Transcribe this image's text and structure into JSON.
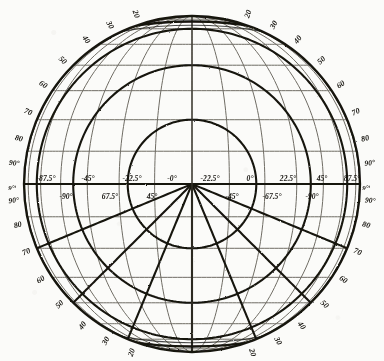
{
  "figure": {
    "background_color": "#fbfbf9",
    "ink_color": "#16140f",
    "faint_ink_color": "#6d6a63"
  },
  "chart_data": {
    "type": "scatter",
    "xlabel": "",
    "ylabel": "",
    "grid": true,
    "legend": "none",
    "projection": {
      "outline": "circle",
      "center_x": 192,
      "center_y": 184,
      "radius": 168,
      "center_meridian_longitude": "0",
      "cap_arc_top": true,
      "cap_arc_bottom": true
    },
    "latitude_ticks": [
      20,
      30,
      40,
      50,
      60,
      70,
      80,
      90
    ],
    "rim_label_quadrants": [
      "top-left",
      "top-right",
      "bottom-left",
      "bottom-right"
    ],
    "equator_labels_upper": [
      "-87.5°",
      "-45°",
      "-22.5°",
      "-0°",
      "-22.5°",
      "0°",
      "22.5°",
      "45°",
      "87.5°"
    ],
    "equator_labels_lower": [
      "-90°",
      "67.5°",
      "45°",
      "-45°",
      "-67.5°",
      "-90°"
    ],
    "edge_markers": [
      "9°ᵗ",
      "9°ᵗ"
    ],
    "graticule_fine": {
      "style": "thin grey",
      "parallel_count": 16,
      "meridian_count": 14
    },
    "graticule_bold": {
      "style": "thick black oblique",
      "parallel_count": 7,
      "meridian_count": 9
    }
  },
  "rim_labels": {
    "top_left": [
      {
        "t": "90°",
        "a": -96
      },
      {
        "t": "80",
        "a": -104
      },
      {
        "t": "70",
        "a": -113
      },
      {
        "t": "60",
        "a": -123
      },
      {
        "t": "50",
        "a": -133
      },
      {
        "t": "40",
        "a": -143
      },
      {
        "t": "30",
        "a": -152
      },
      {
        "t": "20",
        "a": -161
      }
    ],
    "top_right": [
      {
        "t": "90°",
        "a": -84
      },
      {
        "t": "80",
        "a": -76
      },
      {
        "t": "70",
        "a": -67
      },
      {
        "t": "60",
        "a": -57
      },
      {
        "t": "50",
        "a": -47
      },
      {
        "t": "40",
        "a": -37
      },
      {
        "t": "30",
        "a": -28
      },
      {
        "t": "20",
        "a": -19
      }
    ],
    "bottom_left": [
      {
        "t": "90°",
        "a": 96
      },
      {
        "t": "80",
        "a": 104
      },
      {
        "t": "70",
        "a": 113
      },
      {
        "t": "60",
        "a": 123
      },
      {
        "t": "50",
        "a": 133
      },
      {
        "t": "40",
        "a": 143
      },
      {
        "t": "30",
        "a": 152
      },
      {
        "t": "20",
        "a": 161
      }
    ],
    "bottom_right": [
      {
        "t": "90°",
        "a": 84
      },
      {
        "t": "80",
        "a": 76
      },
      {
        "t": "70",
        "a": 67
      },
      {
        "t": "60",
        "a": 57
      },
      {
        "t": "50",
        "a": 47
      },
      {
        "t": "40",
        "a": 37
      },
      {
        "t": "30",
        "a": 28
      },
      {
        "t": "20",
        "a": 19
      }
    ]
  },
  "equator_row_upper": [
    {
      "t": "-87.5°",
      "x": 46
    },
    {
      "t": "-45°",
      "x": 88
    },
    {
      "t": "-22.5°",
      "x": 132
    },
    {
      "t": "-0°",
      "x": 172
    },
    {
      "t": "-22.5°",
      "x": 210
    },
    {
      "t": "0°",
      "x": 250
    },
    {
      "t": "22.5°",
      "x": 288
    },
    {
      "t": "45°",
      "x": 322
    },
    {
      "t": "87.5°",
      "x": 352
    }
  ],
  "equator_row_lower": [
    {
      "t": "-90°",
      "x": 66
    },
    {
      "t": "67.5°",
      "x": 110
    },
    {
      "t": "45°",
      "x": 152
    },
    {
      "t": "-45°",
      "x": 232
    },
    {
      "t": "-67.5°",
      "x": 272
    },
    {
      "t": "-90°",
      "x": 312
    }
  ],
  "side_markers": [
    {
      "t": "9°ᵗ",
      "x": 12,
      "y": 190
    },
    {
      "t": "9°ᵗ",
      "x": 366,
      "y": 190
    }
  ]
}
